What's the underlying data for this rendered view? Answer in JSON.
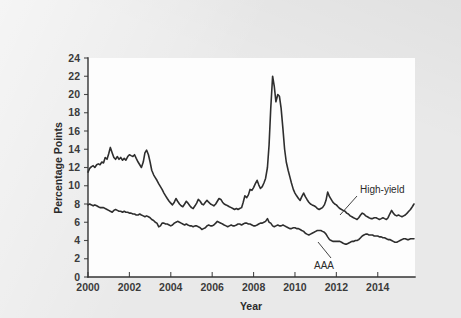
{
  "figure": {
    "background_color": "#e9e9e9",
    "plot_background_color": "#fdfdfd",
    "line_color": "#2e2e2e"
  },
  "chart_data": {
    "type": "line",
    "title": "",
    "subtitle": "",
    "xlabel": "Year",
    "ylabel": "Percentage Points",
    "xlim": [
      2000.0,
      2015.8
    ],
    "ylim": [
      0,
      24
    ],
    "grid": false,
    "legend_position": "inline-annotation",
    "xticks": [
      2000,
      2002,
      2004,
      2006,
      2008,
      2010,
      2012,
      2014
    ],
    "xtick_labels": [
      "2000",
      "2002",
      "2004",
      "2006",
      "2008",
      "2010",
      "2012",
      "2014"
    ],
    "yticks": [
      0,
      2,
      4,
      6,
      8,
      10,
      12,
      14,
      16,
      18,
      20,
      22,
      24
    ],
    "ytick_labels": [
      "0",
      "2",
      "4",
      "6",
      "8",
      "10",
      "12",
      "14",
      "16",
      "18",
      "20",
      "22",
      "24"
    ],
    "annotations": [
      {
        "text": "High-yield",
        "x": 2014.2,
        "y": 10.3
      },
      {
        "text": "AAA",
        "x": 2012.0,
        "y": 2.3
      }
    ],
    "series": [
      {
        "name": "High-yield",
        "label": "High-yield",
        "color": "#2e2e2e",
        "x": [
          2000.0,
          2000.08,
          2000.17,
          2000.25,
          2000.33,
          2000.42,
          2000.5,
          2000.58,
          2000.67,
          2000.75,
          2000.83,
          2000.92,
          2001.0,
          2001.08,
          2001.17,
          2001.25,
          2001.33,
          2001.42,
          2001.5,
          2001.58,
          2001.67,
          2001.75,
          2001.83,
          2001.92,
          2002.0,
          2002.08,
          2002.17,
          2002.25,
          2002.33,
          2002.42,
          2002.5,
          2002.58,
          2002.67,
          2002.75,
          2002.83,
          2002.92,
          2003.0,
          2003.08,
          2003.17,
          2003.25,
          2003.33,
          2003.42,
          2003.5,
          2003.58,
          2003.67,
          2003.75,
          2003.83,
          2003.92,
          2004.0,
          2004.08,
          2004.17,
          2004.25,
          2004.33,
          2004.42,
          2004.5,
          2004.58,
          2004.67,
          2004.75,
          2004.83,
          2004.92,
          2005.0,
          2005.08,
          2005.17,
          2005.25,
          2005.33,
          2005.42,
          2005.5,
          2005.58,
          2005.67,
          2005.75,
          2005.83,
          2005.92,
          2006.0,
          2006.08,
          2006.17,
          2006.25,
          2006.33,
          2006.42,
          2006.5,
          2006.58,
          2006.67,
          2006.75,
          2006.83,
          2006.92,
          2007.0,
          2007.08,
          2007.17,
          2007.25,
          2007.33,
          2007.42,
          2007.5,
          2007.58,
          2007.67,
          2007.75,
          2007.83,
          2007.92,
          2008.0,
          2008.08,
          2008.17,
          2008.25,
          2008.33,
          2008.42,
          2008.5,
          2008.58,
          2008.67,
          2008.75,
          2008.83,
          2008.92,
          2009.0,
          2009.08,
          2009.17,
          2009.25,
          2009.33,
          2009.42,
          2009.5,
          2009.58,
          2009.67,
          2009.75,
          2009.83,
          2009.92,
          2010.0,
          2010.08,
          2010.17,
          2010.25,
          2010.33,
          2010.42,
          2010.5,
          2010.58,
          2010.67,
          2010.75,
          2010.83,
          2010.92,
          2011.0,
          2011.08,
          2011.17,
          2011.25,
          2011.33,
          2011.42,
          2011.5,
          2011.58,
          2011.67,
          2011.75,
          2011.83,
          2011.92,
          2012.0,
          2012.08,
          2012.17,
          2012.25,
          2012.33,
          2012.42,
          2012.5,
          2012.58,
          2012.67,
          2012.75,
          2012.83,
          2012.92,
          2013.0,
          2013.08,
          2013.17,
          2013.25,
          2013.33,
          2013.42,
          2013.5,
          2013.58,
          2013.67,
          2013.75,
          2013.83,
          2013.92,
          2014.0,
          2014.08,
          2014.17,
          2014.25,
          2014.33,
          2014.42,
          2014.5,
          2014.58,
          2014.67,
          2014.75,
          2014.83,
          2014.92,
          2015.0,
          2015.08,
          2015.17,
          2015.25,
          2015.33,
          2015.42,
          2015.5,
          2015.58,
          2015.67,
          2015.75
        ],
        "values": [
          11.5,
          11.9,
          12.1,
          12.2,
          12.0,
          12.3,
          12.4,
          12.3,
          12.6,
          12.5,
          13.1,
          12.9,
          13.5,
          14.2,
          13.6,
          13.1,
          12.9,
          13.2,
          12.9,
          13.1,
          12.8,
          13.0,
          12.8,
          13.2,
          13.4,
          13.3,
          13.2,
          13.4,
          13.0,
          12.6,
          12.3,
          12.0,
          12.6,
          13.6,
          13.9,
          13.4,
          12.6,
          11.7,
          11.2,
          10.9,
          10.6,
          10.2,
          9.9,
          9.6,
          9.2,
          8.9,
          8.6,
          8.3,
          8.1,
          7.9,
          8.2,
          8.6,
          8.3,
          8.0,
          7.8,
          7.7,
          8.0,
          8.3,
          8.1,
          7.8,
          7.6,
          7.5,
          7.8,
          8.1,
          8.5,
          8.3,
          8.0,
          7.9,
          8.2,
          8.4,
          8.2,
          8.0,
          7.9,
          7.8,
          8.0,
          8.3,
          8.6,
          8.5,
          8.2,
          8.0,
          7.9,
          7.8,
          7.7,
          7.6,
          7.5,
          7.4,
          7.5,
          7.4,
          7.5,
          7.6,
          8.2,
          8.9,
          8.7,
          9.0,
          9.6,
          9.5,
          9.8,
          10.2,
          10.6,
          10.1,
          9.7,
          9.9,
          10.3,
          10.8,
          12.0,
          14.5,
          18.5,
          22.0,
          20.9,
          19.2,
          20.0,
          19.8,
          18.5,
          16.2,
          14.0,
          12.6,
          11.7,
          11.0,
          10.3,
          9.6,
          9.2,
          8.9,
          8.6,
          8.4,
          8.8,
          9.2,
          8.8,
          8.5,
          8.2,
          8.0,
          7.9,
          7.8,
          7.7,
          7.5,
          7.4,
          7.5,
          7.6,
          7.9,
          8.4,
          9.3,
          8.8,
          8.5,
          8.2,
          8.0,
          7.9,
          7.7,
          7.5,
          7.4,
          7.3,
          7.2,
          7.0,
          6.9,
          6.7,
          6.6,
          6.5,
          6.4,
          6.3,
          6.5,
          6.8,
          7.0,
          6.9,
          6.7,
          6.6,
          6.5,
          6.4,
          6.4,
          6.5,
          6.5,
          6.4,
          6.3,
          6.4,
          6.5,
          6.4,
          6.3,
          6.5,
          6.9,
          7.3,
          7.0,
          6.8,
          6.7,
          6.8,
          6.7,
          6.6,
          6.7,
          6.8,
          7.0,
          7.2,
          7.4,
          7.7,
          8.0
        ]
      },
      {
        "name": "AAA",
        "label": "AAA",
        "color": "#2e2e2e",
        "x": [
          2000.0,
          2000.08,
          2000.17,
          2000.25,
          2000.33,
          2000.42,
          2000.5,
          2000.58,
          2000.67,
          2000.75,
          2000.83,
          2000.92,
          2001.0,
          2001.08,
          2001.17,
          2001.25,
          2001.33,
          2001.42,
          2001.5,
          2001.58,
          2001.67,
          2001.75,
          2001.83,
          2001.92,
          2002.0,
          2002.08,
          2002.17,
          2002.25,
          2002.33,
          2002.42,
          2002.5,
          2002.58,
          2002.67,
          2002.75,
          2002.83,
          2002.92,
          2003.0,
          2003.08,
          2003.17,
          2003.25,
          2003.33,
          2003.42,
          2003.5,
          2003.58,
          2003.67,
          2003.75,
          2003.83,
          2003.92,
          2004.0,
          2004.08,
          2004.17,
          2004.25,
          2004.33,
          2004.42,
          2004.5,
          2004.58,
          2004.67,
          2004.75,
          2004.83,
          2004.92,
          2005.0,
          2005.08,
          2005.17,
          2005.25,
          2005.33,
          2005.42,
          2005.5,
          2005.58,
          2005.67,
          2005.75,
          2005.83,
          2005.92,
          2006.0,
          2006.08,
          2006.17,
          2006.25,
          2006.33,
          2006.42,
          2006.5,
          2006.58,
          2006.67,
          2006.75,
          2006.83,
          2006.92,
          2007.0,
          2007.08,
          2007.17,
          2007.25,
          2007.33,
          2007.42,
          2007.5,
          2007.58,
          2007.67,
          2007.75,
          2007.83,
          2007.92,
          2008.0,
          2008.08,
          2008.17,
          2008.25,
          2008.33,
          2008.42,
          2008.5,
          2008.58,
          2008.67,
          2008.75,
          2008.83,
          2008.92,
          2009.0,
          2009.08,
          2009.17,
          2009.25,
          2009.33,
          2009.42,
          2009.5,
          2009.58,
          2009.67,
          2009.75,
          2009.83,
          2009.92,
          2010.0,
          2010.08,
          2010.17,
          2010.25,
          2010.33,
          2010.42,
          2010.5,
          2010.58,
          2010.67,
          2010.75,
          2010.83,
          2010.92,
          2011.0,
          2011.08,
          2011.17,
          2011.25,
          2011.33,
          2011.42,
          2011.5,
          2011.58,
          2011.67,
          2011.75,
          2011.83,
          2011.92,
          2012.0,
          2012.08,
          2012.17,
          2012.25,
          2012.33,
          2012.42,
          2012.5,
          2012.58,
          2012.67,
          2012.75,
          2012.83,
          2012.92,
          2013.0,
          2013.08,
          2013.17,
          2013.25,
          2013.33,
          2013.42,
          2013.5,
          2013.58,
          2013.67,
          2013.75,
          2013.83,
          2013.92,
          2014.0,
          2014.08,
          2014.17,
          2014.25,
          2014.33,
          2014.42,
          2014.5,
          2014.58,
          2014.67,
          2014.75,
          2014.83,
          2014.92,
          2015.0,
          2015.08,
          2015.17,
          2015.25,
          2015.33,
          2015.42,
          2015.5,
          2015.58,
          2015.67,
          2015.75
        ],
        "values": [
          7.9,
          8.0,
          7.9,
          7.8,
          7.9,
          7.8,
          7.7,
          7.6,
          7.6,
          7.6,
          7.5,
          7.4,
          7.3,
          7.2,
          7.1,
          7.3,
          7.4,
          7.3,
          7.2,
          7.2,
          7.1,
          7.2,
          7.1,
          7.1,
          7.0,
          7.0,
          6.9,
          6.9,
          6.8,
          6.8,
          6.9,
          6.8,
          6.7,
          6.6,
          6.7,
          6.6,
          6.5,
          6.3,
          6.2,
          6.0,
          5.9,
          5.5,
          5.6,
          5.9,
          5.9,
          5.8,
          5.8,
          5.7,
          5.6,
          5.7,
          5.9,
          6.0,
          6.1,
          6.0,
          5.9,
          5.8,
          5.7,
          5.8,
          5.7,
          5.6,
          5.6,
          5.5,
          5.6,
          5.6,
          5.5,
          5.4,
          5.2,
          5.3,
          5.4,
          5.6,
          5.7,
          5.6,
          5.6,
          5.7,
          5.9,
          6.1,
          6.0,
          5.9,
          5.8,
          5.7,
          5.6,
          5.5,
          5.6,
          5.7,
          5.6,
          5.6,
          5.7,
          5.8,
          5.8,
          5.7,
          5.8,
          5.9,
          5.9,
          5.8,
          5.8,
          5.7,
          5.6,
          5.6,
          5.7,
          5.8,
          5.9,
          5.9,
          6.0,
          6.1,
          6.4,
          6.0,
          5.9,
          5.6,
          5.5,
          5.6,
          5.7,
          5.6,
          5.6,
          5.7,
          5.6,
          5.5,
          5.4,
          5.3,
          5.3,
          5.4,
          5.4,
          5.3,
          5.3,
          5.2,
          5.1,
          5.0,
          4.8,
          4.7,
          4.6,
          4.7,
          4.8,
          4.9,
          5.0,
          5.1,
          5.1,
          5.1,
          5.0,
          4.9,
          4.7,
          4.4,
          4.1,
          4.0,
          3.9,
          3.9,
          3.9,
          3.9,
          3.9,
          3.8,
          3.7,
          3.6,
          3.6,
          3.7,
          3.8,
          3.9,
          3.9,
          4.0,
          4.0,
          4.1,
          4.3,
          4.5,
          4.6,
          4.7,
          4.7,
          4.6,
          4.6,
          4.6,
          4.5,
          4.5,
          4.5,
          4.4,
          4.4,
          4.3,
          4.3,
          4.2,
          4.1,
          4.1,
          4.0,
          3.9,
          3.8,
          3.8,
          3.9,
          4.0,
          4.1,
          4.2,
          4.2,
          4.1,
          4.1,
          4.2,
          4.2,
          4.2
        ]
      }
    ]
  }
}
